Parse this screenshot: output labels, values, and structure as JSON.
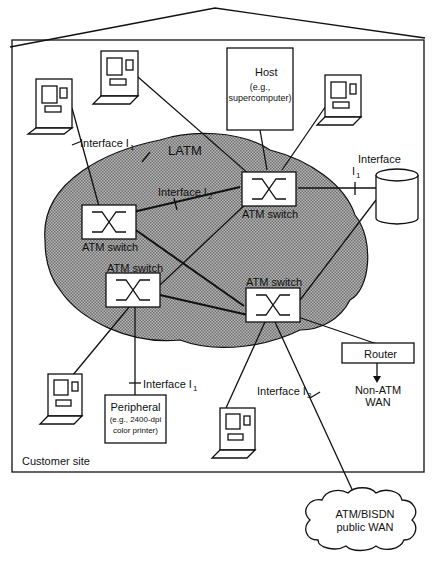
{
  "diagram": {
    "site_label": "Customer site",
    "latm_label": "LATM",
    "switches": [
      {
        "id": "sw1",
        "label": "ATM switch"
      },
      {
        "id": "sw2",
        "label": "ATM switch"
      },
      {
        "id": "sw3",
        "label": "ATM switch"
      },
      {
        "id": "sw4",
        "label": "ATM switch"
      }
    ],
    "host": {
      "title": "Host",
      "subtitle_1": "(e.g.,",
      "subtitle_2": "supercomputer)"
    },
    "peripheral": {
      "title": "Peripheral",
      "subtitle_1": "(e.g., 2400-dpi",
      "subtitle_2": "color printer)"
    },
    "router": {
      "label": "Router",
      "wan_line1": "Non-ATM",
      "wan_line2": "WAN"
    },
    "public_wan": {
      "line1": "ATM/BISDN",
      "line2": "public WAN"
    },
    "interfaces": {
      "i1_top": {
        "text": "Interface I",
        "sub": "1"
      },
      "i1_right": {
        "text": "Interface",
        "sub_line": "I",
        "sub": "1"
      },
      "i2": {
        "text": "Interface I",
        "sub": "2"
      },
      "i1_bottom": {
        "text": "Interface I",
        "sub": "1"
      },
      "i3": {
        "text": "Interface I",
        "sub": "3"
      }
    },
    "colors": {
      "line": "#111111",
      "cloud_fill": "#9a9a9a",
      "background": "#ffffff"
    }
  }
}
